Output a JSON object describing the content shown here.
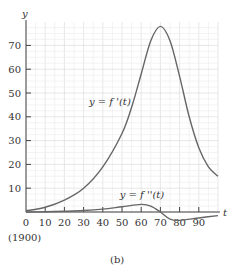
{
  "chart_data": {
    "type": "line",
    "title": "",
    "caption": "(b)",
    "xlabel": "t",
    "ylabel": "y",
    "x_origin_note": "(1900)",
    "xlim": [
      0,
      100
    ],
    "ylim": [
      0,
      80
    ],
    "grid": true,
    "x_ticks": [
      0,
      10,
      20,
      30,
      40,
      50,
      60,
      70,
      80,
      90
    ],
    "y_ticks": [
      10,
      20,
      30,
      40,
      50,
      60,
      70
    ],
    "series": [
      {
        "name": "y = f '(t)",
        "x": [
          0,
          10,
          20,
          30,
          40,
          50,
          55,
          60,
          65,
          70,
          75,
          80,
          85,
          90,
          95,
          100
        ],
        "y": [
          0.5,
          2,
          5,
          10,
          19,
          33,
          44,
          58,
          72,
          78,
          72,
          57,
          40,
          27,
          19,
          15
        ]
      },
      {
        "name": "y = f ''(t)",
        "x": [
          0,
          10,
          20,
          30,
          40,
          50,
          60,
          65,
          70,
          75,
          80,
          90,
          100
        ],
        "y": [
          0,
          0.1,
          0.3,
          0.6,
          1.2,
          2.2,
          3.2,
          2.5,
          0,
          -3,
          -3.5,
          -2.5,
          -1.5
        ]
      }
    ],
    "annotations": [
      {
        "text": "y = f '(t)",
        "x": 38,
        "y": 45
      },
      {
        "text": "y = f ''(t)",
        "x": 54,
        "y": 6
      }
    ]
  }
}
